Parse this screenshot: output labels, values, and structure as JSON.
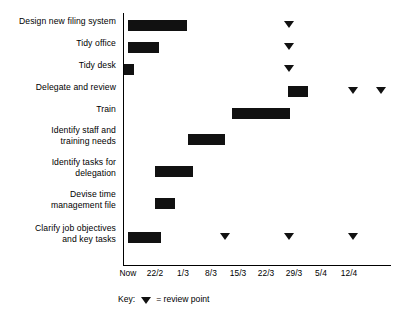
{
  "chart_data": {
    "type": "bar",
    "chart_kind": "gantt",
    "title": "",
    "xlabel": "",
    "ylabel": "",
    "grid": false,
    "axis_ticks": [
      "Now",
      "22/2",
      "1/3",
      "8/3",
      "15/3",
      "22/3",
      "29/3",
      "5/4",
      "12/4"
    ],
    "tick_px": [
      128,
      155,
      183,
      211,
      238,
      266,
      294,
      321,
      349
    ],
    "xlim": [
      "Now",
      "12/4"
    ],
    "categories": [
      "Design new filing system",
      "Tidy office",
      "Tidy desk",
      "Delegate and review",
      "Train",
      "Identify staff and\ntraining needs",
      "Identify tasks for\ndelegation",
      "Devise time\nmanagement file",
      "Clarify job objectives\nand key tasks"
    ],
    "tasks": [
      {
        "label": "Design new filing system",
        "row_y": 20,
        "bar": {
          "start_tick": "Now",
          "end_tick": "1/3",
          "x": 128,
          "width": 59
        },
        "reviews": [
          {
            "tick": "22/3",
            "x": 289
          }
        ]
      },
      {
        "label": "Tidy office",
        "row_y": 42,
        "bar": {
          "start_tick": "Now",
          "end_tick": "22/2",
          "x": 128,
          "width": 31
        },
        "reviews": [
          {
            "tick": "22/3",
            "x": 289
          }
        ]
      },
      {
        "label": "Tidy desk",
        "row_y": 64,
        "bar": {
          "start_tick": "Now",
          "end_tick": "Now",
          "x": 124,
          "width": 10
        },
        "reviews": [
          {
            "tick": "22/3",
            "x": 289
          }
        ]
      },
      {
        "label": "Delegate and review",
        "row_y": 86,
        "bar": {
          "start_tick": "22/3",
          "end_tick": "29/3",
          "x": 288,
          "width": 20
        },
        "reviews": [
          {
            "tick": "5/4",
            "x": 353
          },
          {
            "tick": "12/4",
            "x": 381
          }
        ]
      },
      {
        "label": "Train",
        "row_y": 108,
        "bar": {
          "start_tick": "8/3",
          "end_tick": "22/3",
          "x": 232,
          "width": 58
        },
        "reviews": []
      },
      {
        "label": "Identify staff and\ntraining needs",
        "row_y": 134,
        "bar": {
          "start_tick": "1/3",
          "end_tick": "8/3",
          "x": 188,
          "width": 37
        },
        "reviews": []
      },
      {
        "label": "Identify tasks for\ndelegation",
        "row_y": 166,
        "bar": {
          "start_tick": "22/2",
          "end_tick": "1/3",
          "x": 155,
          "width": 38
        },
        "reviews": []
      },
      {
        "label": "Devise time\nmanagement file",
        "row_y": 198,
        "bar": {
          "start_tick": "22/2",
          "end_tick": "22/2",
          "x": 155,
          "width": 20
        },
        "reviews": []
      },
      {
        "label": "Clarify job objectives\nand key tasks",
        "row_y": 232,
        "bar": {
          "start_tick": "Now",
          "end_tick": "22/2",
          "x": 128,
          "width": 33
        },
        "reviews": [
          {
            "tick": "8/3",
            "x": 225
          },
          {
            "tick": "22/3",
            "x": 289
          },
          {
            "tick": "5/4",
            "x": 353
          }
        ]
      }
    ],
    "legend": {
      "position": "bottom-left",
      "key_word": "Key:",
      "marker_symbol": "▼",
      "entry_text": "= review point"
    },
    "colors": {
      "bar": "#111111",
      "marker": "#111111",
      "axis": "#000000",
      "background": "#ffffff",
      "text": "#000000"
    }
  },
  "label_positions": {
    "rows": [
      {
        "top": 16
      },
      {
        "top": 38
      },
      {
        "top": 60
      },
      {
        "top": 82
      },
      {
        "top": 104
      },
      {
        "top": 125
      },
      {
        "top": 157
      },
      {
        "top": 189
      },
      {
        "top": 223
      }
    ]
  }
}
